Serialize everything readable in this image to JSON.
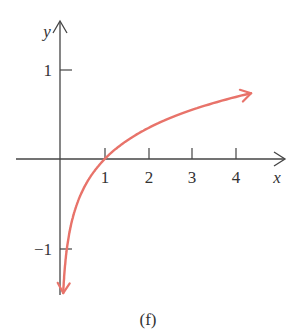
{
  "chart_data": {
    "type": "line",
    "title": "",
    "caption": "(f)",
    "xlabel": "x",
    "ylabel": "y",
    "x_ticks": [
      1,
      2,
      3,
      4
    ],
    "x_tick_labels": [
      "1",
      "2",
      "3",
      "4"
    ],
    "y_ticks": [
      1,
      -1
    ],
    "y_tick_labels": [
      "1",
      "−1"
    ],
    "xlim": [
      -1,
      4.5
    ],
    "ylim": [
      -1.6,
      1.5
    ],
    "grid": false,
    "legend": null,
    "series": [
      {
        "name": "logarithmic curve",
        "color": "#E8736A",
        "function": "y = 0.5 ln x (approx.)",
        "x": [
          0.05,
          0.1,
          0.2,
          0.3,
          0.5,
          0.75,
          1,
          1.5,
          2,
          2.5,
          3,
          3.5,
          4,
          4.35
        ],
        "y": [
          -1.5,
          -1.15,
          -0.8,
          -0.6,
          -0.35,
          -0.14,
          0,
          0.2,
          0.35,
          0.46,
          0.55,
          0.63,
          0.69,
          0.73
        ],
        "arrow_both_ends": true
      }
    ]
  },
  "colors": {
    "axis": "#444444",
    "curve": "#E8736A"
  }
}
